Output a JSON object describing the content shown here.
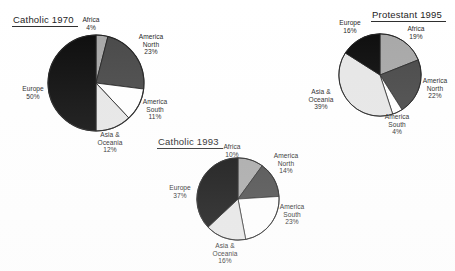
{
  "page": {
    "background": "#ffffff",
    "width": 455,
    "height": 271
  },
  "palette": {
    "Africa": "#a6a6a6",
    "America North": "#454545",
    "America South": "#ffffff",
    "Asia & Oceania": "#e6e6e6",
    "Europe": "#080808",
    "outline": "#1c1c1c",
    "text": "#222222"
  },
  "chart_data": [
    {
      "type": "pie",
      "title": "Catholic 1970",
      "categories": [
        "Africa",
        "America North",
        "America South",
        "Asia & Oceania",
        "Europe"
      ],
      "values": [
        4,
        23,
        11,
        12,
        50
      ],
      "labels": [
        "4%",
        "23%",
        "11%",
        "12%",
        "50%"
      ],
      "unit": "%",
      "start_angle": 0,
      "direction": "clockwise",
      "legend": "none",
      "grid": false,
      "label_lines": [
        {
          "name": "Africa",
          "pct": "4%"
        },
        {
          "name": "America North",
          "pct": "23%"
        },
        {
          "name": "America South",
          "pct": "11%"
        },
        {
          "name": "Asia & Oceania",
          "pct": "12%"
        },
        {
          "name": "Europe",
          "pct": "50%"
        }
      ]
    },
    {
      "type": "pie",
      "title": "Catholic 1993",
      "categories": [
        "Africa",
        "America North",
        "America South",
        "Asia & Oceania",
        "Europe"
      ],
      "values": [
        10,
        14,
        23,
        16,
        37
      ],
      "labels": [
        "10%",
        "14%",
        "23%",
        "16%",
        "37%"
      ],
      "unit": "%",
      "start_angle": 0,
      "direction": "clockwise",
      "legend": "none",
      "grid": false,
      "label_lines": [
        {
          "name": "Africa",
          "pct": "10%"
        },
        {
          "name": "America North",
          "pct": "14%"
        },
        {
          "name": "America South",
          "pct": "23%"
        },
        {
          "name": "Asia & Oceania",
          "pct": "16%"
        },
        {
          "name": "Europe",
          "pct": "37%"
        }
      ]
    },
    {
      "type": "pie",
      "title": "Protestant 1995",
      "categories": [
        "Africa",
        "America North",
        "America South",
        "Asia & Oceania",
        "Europe"
      ],
      "values": [
        19,
        22,
        4,
        39,
        16
      ],
      "labels": [
        "19%",
        "22%",
        "4%",
        "39%",
        "16%"
      ],
      "unit": "%",
      "start_angle": 0,
      "direction": "clockwise",
      "legend": "none",
      "grid": false,
      "label_lines": [
        {
          "name": "Africa",
          "pct": "19%"
        },
        {
          "name": "America North",
          "pct": "22%"
        },
        {
          "name": "America South",
          "pct": "4%"
        },
        {
          "name": "Asia & Oceania",
          "pct": "39%"
        },
        {
          "name": "Europe",
          "pct": "16%"
        }
      ]
    }
  ],
  "charts": {
    "c1970": {
      "title": "Catholic 1970",
      "africa_name": "Africa",
      "africa_pct": "4%",
      "amnorth_name1": "America",
      "amnorth_name2": "North",
      "amnorth_pct": "23%",
      "amsouth_name1": "America",
      "amsouth_name2": "South",
      "amsouth_pct": "11%",
      "asia_name1": "Asia &",
      "asia_name2": "Oceania",
      "asia_pct": "12%",
      "europe_name": "Europe",
      "europe_pct": "50%"
    },
    "c1993": {
      "title": "Catholic 1993",
      "africa_name": "Africa",
      "africa_pct": "10%",
      "amnorth_name1": "America",
      "amnorth_name2": "North",
      "amnorth_pct": "14%",
      "amsouth_name1": "America",
      "amsouth_name2": "South",
      "amsouth_pct": "23%",
      "asia_name1": "Asia &",
      "asia_name2": "Oceania",
      "asia_pct": "16%",
      "europe_name": "Europe",
      "europe_pct": "37%"
    },
    "p1995": {
      "title": "Protestant 1995",
      "africa_name": "Africa",
      "africa_pct": "19%",
      "amnorth_name1": "America",
      "amnorth_name2": "North",
      "amnorth_pct": "22%",
      "amsouth_name1": "America",
      "amsouth_name2": "South",
      "amsouth_pct": "4%",
      "asia_name1": "Asia &",
      "asia_name2": "Oceania",
      "asia_pct": "39%",
      "europe_name": "Europe",
      "europe_pct": "16%"
    }
  }
}
